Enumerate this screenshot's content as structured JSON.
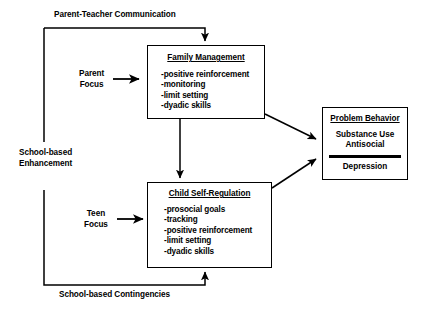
{
  "diagram": {
    "boxes": {
      "family_management": {
        "title": "Family Management",
        "items": [
          "-positive reinforcement",
          "-monitoring",
          "-limit setting",
          "-dyadic skills"
        ]
      },
      "child_self_regulation": {
        "title": "Child Self-Regulation",
        "items": [
          "-prosocial goals",
          "-tracking",
          "-positive reinforcement",
          "-limit setting",
          "-dyadic skills"
        ]
      },
      "problem_behavior": {
        "title": "Problem Behavior",
        "upper_items": [
          "Substance Use",
          "Antisocial"
        ],
        "lower_items": [
          "Depression"
        ]
      }
    },
    "labels": {
      "parent_teacher_communication": "Parent-Teacher Communication",
      "school_based_enhancement_line1": "School-based",
      "school_based_enhancement_line2": "Enhancement",
      "school_based_contingencies": "School-based Contingencies",
      "parent_focus_line1": "Parent",
      "parent_focus_line2": "Focus",
      "teen_focus_line1": "Teen",
      "teen_focus_line2": "Focus"
    },
    "colors": {
      "stroke": "#000000",
      "background": "#ffffff",
      "text": "#000000"
    }
  }
}
